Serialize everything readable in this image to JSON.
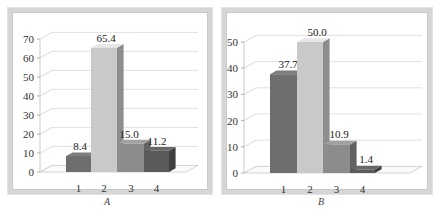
{
  "chart_data": [
    {
      "type": "bar",
      "panel": "A",
      "title": "",
      "caption": "A",
      "categories": [
        "1",
        "2",
        "3",
        "4"
      ],
      "values": [
        8.4,
        65.4,
        15.0,
        11.2
      ],
      "value_labels": [
        "8.4",
        "65.4",
        "15.0",
        "11.2"
      ],
      "xlabel": "",
      "ylabel": "",
      "ylim": [
        0,
        70
      ],
      "yticks": [
        0,
        10,
        20,
        30,
        40,
        50,
        60,
        70
      ],
      "grid": true,
      "style": "3d-bar",
      "bar_colors": [
        "#6e6e6e",
        "#c9c9c9",
        "#8c8c8c",
        "#5a5a5a"
      ],
      "legend": null
    },
    {
      "type": "bar",
      "panel": "B",
      "title": "",
      "caption": "B",
      "categories": [
        "1",
        "2",
        "3",
        "4"
      ],
      "values": [
        37.7,
        50.0,
        10.9,
        1.4
      ],
      "value_labels": [
        "37.7",
        "50.0",
        "10.9",
        "1.4"
      ],
      "xlabel": "",
      "ylabel": "",
      "ylim": [
        0,
        50
      ],
      "yticks": [
        0,
        10,
        20,
        30,
        40,
        50
      ],
      "grid": true,
      "style": "3d-bar",
      "bar_colors": [
        "#6e6e6e",
        "#c9c9c9",
        "#8c8c8c",
        "#5a5a5a"
      ],
      "legend": null
    }
  ],
  "captions": {
    "a": "A",
    "b": "B"
  }
}
